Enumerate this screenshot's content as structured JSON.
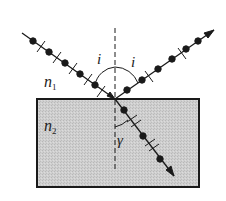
{
  "diagram": {
    "title": "",
    "labels": {
      "incident_angle": "i",
      "reflected_angle": "i",
      "medium1": "n",
      "medium1_sub": "1",
      "medium2": "n",
      "medium2_sub": "2",
      "refraction_angle": "γ"
    },
    "colors": {
      "line": "#1a1a1a",
      "medium2_fill": "#c8c8c8",
      "background": "#ffffff"
    },
    "geometry": {
      "box": {
        "x": 37,
        "y": 99,
        "w": 162,
        "h": 88
      },
      "incidence_point": [
        115,
        99
      ],
      "normal": {
        "x": 115,
        "y1": 28,
        "y2": 172
      },
      "incident_ray": {
        "from": [
          22,
          33
        ],
        "to": [
          115,
          99
        ]
      },
      "reflected_ray": {
        "from": [
          115,
          99
        ],
        "to": [
          214,
          30
        ]
      },
      "refracted_ray": {
        "from": [
          115,
          99
        ],
        "to": [
          174,
          176
        ]
      }
    }
  }
}
